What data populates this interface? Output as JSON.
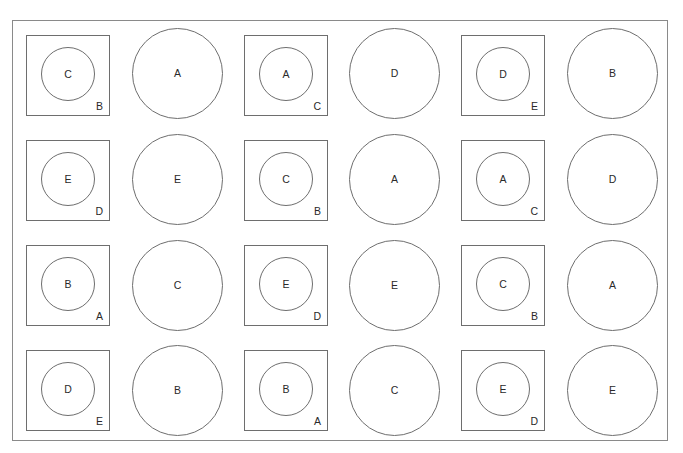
{
  "diagram": {
    "layout": {
      "rows": 4,
      "columns": 6
    },
    "colors": {
      "line": "#6e6e6e",
      "frame": "#8a8a8a",
      "text": "#2a2a2a",
      "background": "#ffffff"
    },
    "rows": [
      {
        "cells": [
          {
            "type": "square",
            "inner": "C",
            "corner": "B"
          },
          {
            "type": "circle",
            "label": "A"
          },
          {
            "type": "square",
            "inner": "A",
            "corner": "C"
          },
          {
            "type": "circle",
            "label": "D"
          },
          {
            "type": "square",
            "inner": "D",
            "corner": "E"
          },
          {
            "type": "circle",
            "label": "B"
          }
        ]
      },
      {
        "cells": [
          {
            "type": "square",
            "inner": "E",
            "corner": "D"
          },
          {
            "type": "circle",
            "label": "E"
          },
          {
            "type": "square",
            "inner": "C",
            "corner": "B"
          },
          {
            "type": "circle",
            "label": "A"
          },
          {
            "type": "square",
            "inner": "A",
            "corner": "C"
          },
          {
            "type": "circle",
            "label": "D"
          }
        ]
      },
      {
        "cells": [
          {
            "type": "square",
            "inner": "B",
            "corner": "A"
          },
          {
            "type": "circle",
            "label": "C"
          },
          {
            "type": "square",
            "inner": "E",
            "corner": "D"
          },
          {
            "type": "circle",
            "label": "E"
          },
          {
            "type": "square",
            "inner": "C",
            "corner": "B"
          },
          {
            "type": "circle",
            "label": "A"
          }
        ]
      },
      {
        "cells": [
          {
            "type": "square",
            "inner": "D",
            "corner": "E"
          },
          {
            "type": "circle",
            "label": "B"
          },
          {
            "type": "square",
            "inner": "B",
            "corner": "A"
          },
          {
            "type": "circle",
            "label": "C"
          },
          {
            "type": "square",
            "inner": "E",
            "corner": "D"
          },
          {
            "type": "circle",
            "label": "E"
          }
        ]
      }
    ]
  }
}
